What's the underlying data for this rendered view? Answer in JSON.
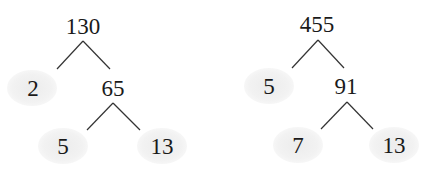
{
  "diagram": {
    "type": "factor-trees",
    "colors": {
      "text": "#1a1a1a",
      "line": "#333333",
      "prime_highlight": "#f0f0f0"
    },
    "trees": [
      {
        "root": "130",
        "left_leaf": "2",
        "inner": "65",
        "inner_left": "5",
        "inner_right": "13"
      },
      {
        "root": "455",
        "left_leaf": "5",
        "inner": "91",
        "inner_left": "7",
        "inner_right": "13"
      }
    ]
  }
}
